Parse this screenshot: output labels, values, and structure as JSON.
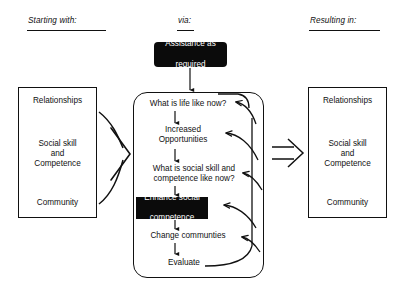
{
  "diagram": {
    "columns": [
      {
        "id": "starting",
        "label": "Starting with:"
      },
      {
        "id": "via",
        "label": "via:"
      },
      {
        "id": "resulting",
        "label": "Resulting in:"
      }
    ],
    "input_panel": {
      "name": "starting-with-panel",
      "lines": [
        "Relationships",
        "Social skill",
        "and",
        "Competence",
        "Community"
      ]
    },
    "output_panel": {
      "name": "resulting-in-panel",
      "lines": [
        "Relationships",
        "Social skill",
        "and",
        "Competence",
        "Community"
      ]
    },
    "support_chip": {
      "label_line_1": "Assistance as",
      "label_line_2": "required"
    },
    "process": {
      "nodes": [
        {
          "id": "life-now",
          "label": "What is life like now?",
          "style": "plain"
        },
        {
          "id": "increased-opportunities",
          "label": "Increased\nOpportunities",
          "style": "plain"
        },
        {
          "id": "skill-now",
          "label": "What is social skill and\ncompetence like now?",
          "style": "plain"
        },
        {
          "id": "enhance-competence",
          "label_line_1": "Enhance social",
          "label_line_2": "competence",
          "style": "inverted"
        },
        {
          "id": "change-communities",
          "label": "Change communties",
          "style": "plain"
        },
        {
          "id": "evaluate",
          "label": "Evaluate",
          "style": "plain"
        }
      ]
    },
    "colors": {
      "stroke": "#111111",
      "chip_fill": "#0b0b0b",
      "chip_text": "#ffffff",
      "background": "#ffffff"
    }
  }
}
